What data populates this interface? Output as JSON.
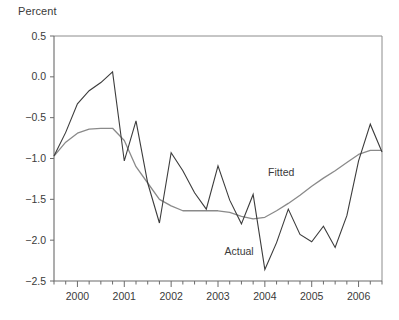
{
  "chart_data": {
    "type": "line",
    "title": "",
    "ylabel": "Percent",
    "xlabel": "",
    "ylim": [
      -2.5,
      0.5
    ],
    "xlim": [
      1999.5,
      2006.5
    ],
    "yticks": [
      0.5,
      0.0,
      -0.5,
      -1.0,
      -1.5,
      -2.0,
      -2.5
    ],
    "ytick_labels": [
      "0.5",
      "0.0",
      "−0.5",
      "−1.0",
      "−1.5",
      "−2.0",
      "−2.5"
    ],
    "xticks": [
      2000,
      2001,
      2002,
      2003,
      2004,
      2005,
      2006
    ],
    "xtick_labels": [
      "2000",
      "2001",
      "2002",
      "2003",
      "2004",
      "2005",
      "2006"
    ],
    "minor_xtick_interval": 0.25,
    "grid": false,
    "legend_position": "inline-annotations",
    "annotations": [
      {
        "text": "Fitted",
        "x": 2004.35,
        "y": -1.22
      },
      {
        "text": "Actual",
        "x": 2003.45,
        "y": -2.18
      }
    ],
    "x": [
      1999.5,
      1999.75,
      2000.0,
      2000.25,
      2000.5,
      2000.75,
      2001.0,
      2001.25,
      2001.5,
      2001.75,
      2002.0,
      2002.25,
      2002.5,
      2002.75,
      2003.0,
      2003.25,
      2003.5,
      2003.75,
      2004.0,
      2004.25,
      2004.5,
      2004.75,
      2005.0,
      2005.25,
      2005.5,
      2005.75,
      2006.0,
      2006.25,
      2006.5
    ],
    "series": [
      {
        "name": "Actual",
        "color": "#3c3c3c",
        "values": [
          -0.97,
          -0.68,
          -0.33,
          -0.17,
          -0.07,
          0.06,
          -1.03,
          -0.54,
          -1.3,
          -1.79,
          -0.93,
          -1.15,
          -1.42,
          -1.62,
          -1.09,
          -1.51,
          -1.8,
          -1.44,
          -2.36,
          -2.03,
          -1.62,
          -1.93,
          -2.02,
          -1.83,
          -2.09,
          -1.7,
          -1.03,
          -0.58,
          -0.92
        ]
      },
      {
        "name": "Fitted",
        "color": "#8a8a8a",
        "values": [
          -0.97,
          -0.8,
          -0.69,
          -0.64,
          -0.63,
          -0.63,
          -0.78,
          -1.1,
          -1.3,
          -1.5,
          -1.58,
          -1.64,
          -1.64,
          -1.64,
          -1.64,
          -1.66,
          -1.71,
          -1.74,
          -1.72,
          -1.64,
          -1.55,
          -1.45,
          -1.34,
          -1.24,
          -1.15,
          -1.05,
          -0.95,
          -0.9,
          -0.9
        ]
      }
    ]
  },
  "plot_geometry": {
    "left_px": 54,
    "right_px": 382,
    "top_px": 36,
    "bottom_px": 281
  }
}
